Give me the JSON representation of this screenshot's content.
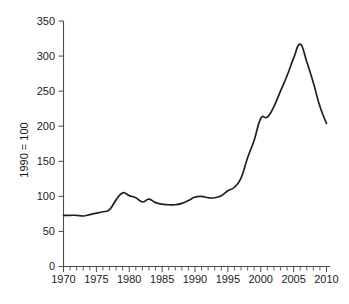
{
  "chart_data": {
    "type": "line",
    "title": "",
    "subtitle": "",
    "xlabel": "",
    "ylabel": "1990 = 100",
    "xlim": [
      1970,
      2010
    ],
    "ylim": [
      0,
      350
    ],
    "grid": false,
    "legend": null,
    "y_ticks": [
      0,
      50,
      100,
      150,
      200,
      250,
      300,
      350
    ],
    "y_tick_labels": [
      "0",
      "50",
      "100",
      "150",
      "200",
      "250",
      "300",
      "350"
    ],
    "x_ticks": [
      1970,
      1975,
      1980,
      1985,
      1990,
      1995,
      2000,
      2005,
      2010
    ],
    "x_tick_labels": [
      "1970",
      "1975",
      "1980",
      "1985",
      "1990",
      "1995",
      "2000",
      "2005",
      "2010"
    ],
    "x_minor_tick_step": 1,
    "line_color": "#231f20",
    "series": [
      {
        "name": "index",
        "x": [
          1970,
          1971,
          1972,
          1973,
          1974,
          1975,
          1976,
          1977,
          1978,
          1979,
          1980,
          1981,
          1982,
          1983,
          1984,
          1985,
          1986,
          1987,
          1988,
          1989,
          1990,
          1991,
          1992,
          1993,
          1994,
          1995,
          1996,
          1997,
          1998,
          1999,
          2000,
          2001,
          2002,
          2003,
          2004,
          2005,
          2006,
          2007,
          2008,
          2009,
          2010
        ],
        "values": [
          73,
          73,
          73,
          72,
          74,
          76,
          78,
          81,
          95,
          105,
          101,
          98,
          92,
          96,
          91,
          89,
          88,
          88,
          90,
          94,
          99,
          100,
          98,
          98,
          101,
          108,
          113,
          126,
          155,
          180,
          211,
          213,
          228,
          250,
          272,
          297,
          317,
          292,
          262,
          228,
          204
        ]
      }
    ],
    "annotations": []
  }
}
